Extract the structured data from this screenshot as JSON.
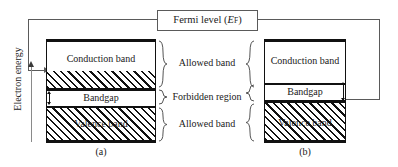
{
  "figure": {
    "fermi": {
      "label_main": "Fermi level (",
      "label_italic": "E",
      "label_sub": "F",
      "label_close": ")"
    },
    "axis": {
      "energy_label": "Electron energy"
    },
    "center_labels": [
      {
        "text": "Allowed band"
      },
      {
        "text": "Forbidden region"
      },
      {
        "text": "Allowed band"
      }
    ],
    "diagram_a": {
      "caption": "(a)",
      "conduction_label": "Conduction band",
      "bandgap_label": "Bandgap",
      "valence_label": "Valence band"
    },
    "diagram_b": {
      "caption": "(b)",
      "conduction_label": "Conduction band",
      "bandgap_label": "Bandgap",
      "valence_label": "Valence band"
    },
    "colors": {
      "band_edge": "#111111",
      "hatch": "#111111",
      "connector": "#5a5a5a",
      "background": "#ffffff",
      "text": "#1a1a1a"
    }
  }
}
